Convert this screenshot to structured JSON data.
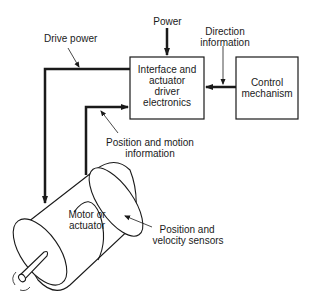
{
  "diagram": {
    "blocks": {
      "interface": {
        "line1": "Interface and",
        "line2": "actuator",
        "line3": "driver",
        "line4": "electronics"
      },
      "control": {
        "line1": "Control",
        "line2": "mechanism"
      },
      "motor": {
        "line1": "Motor or",
        "line2": "actuator"
      }
    },
    "labels": {
      "power": "Power",
      "direction_line1": "Direction",
      "direction_line2": "information",
      "drive_power": "Drive power",
      "position_motion_line1": "Position and motion",
      "position_motion_line2": "information",
      "sensors_line1": "Position and",
      "sensors_line2": "velocity sensors"
    }
  }
}
